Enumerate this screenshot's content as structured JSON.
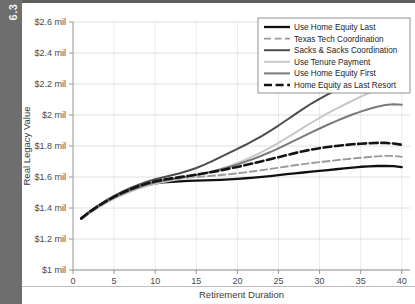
{
  "figure": {
    "spine_label": "6.3",
    "background": "#ffffff",
    "spine_color": "#6e6e6e"
  },
  "chart_data": {
    "type": "line",
    "title": "",
    "xlabel": "Retirement Duration",
    "ylabel": "Real Legacy Value",
    "xlim": [
      0,
      41
    ],
    "ylim": [
      1.0,
      2.6
    ],
    "xticks": [
      0,
      5,
      10,
      15,
      20,
      25,
      30,
      35,
      40
    ],
    "xticklabels": [
      "0",
      "5",
      "10",
      "15",
      "20",
      "25",
      "30",
      "35",
      "40"
    ],
    "yticks": [
      1.0,
      1.2,
      1.4,
      1.6,
      1.8,
      2.0,
      2.2,
      2.4,
      2.6
    ],
    "yticklabels": [
      "$1 mil",
      "$1.2 mil",
      "$1.4 mil",
      "$1.6 mil",
      "$1.8 mil",
      "$2 mil",
      "$2.2 mil",
      "$2.4 mil",
      "$2.6 mil"
    ],
    "units": "millions of dollars",
    "grid": {
      "horizontal": true,
      "vertical": true
    },
    "legend": {
      "position": "top-right",
      "border": true
    },
    "x": [
      1,
      2,
      3,
      4,
      5,
      6,
      7,
      8,
      9,
      10,
      11,
      12,
      13,
      14,
      15,
      16,
      17,
      18,
      19,
      20,
      21,
      22,
      23,
      24,
      25,
      26,
      27,
      28,
      29,
      30,
      31,
      32,
      33,
      34,
      35,
      36,
      37,
      38,
      39,
      40
    ],
    "series": [
      {
        "name": "Use Home Equity Last",
        "color": "#111111",
        "width": 2.3,
        "dash": "none",
        "values": [
          1.33,
          1.37,
          1.405,
          1.437,
          1.465,
          1.49,
          1.512,
          1.531,
          1.547,
          1.559,
          1.566,
          1.569,
          1.572,
          1.575,
          1.577,
          1.578,
          1.58,
          1.582,
          1.585,
          1.588,
          1.592,
          1.596,
          1.601,
          1.606,
          1.612,
          1.618,
          1.624,
          1.629,
          1.634,
          1.639,
          1.644,
          1.65,
          1.656,
          1.661,
          1.666,
          1.669,
          1.671,
          1.672,
          1.67,
          1.664
        ]
      },
      {
        "name": "Texas Tech Coordination",
        "color": "#9a9a9a",
        "width": 1.9,
        "dash": "7,3.5",
        "values": [
          1.332,
          1.373,
          1.409,
          1.442,
          1.471,
          1.497,
          1.52,
          1.54,
          1.557,
          1.571,
          1.58,
          1.586,
          1.591,
          1.596,
          1.6,
          1.604,
          1.608,
          1.613,
          1.618,
          1.624,
          1.63,
          1.637,
          1.644,
          1.652,
          1.66,
          1.668,
          1.676,
          1.683,
          1.69,
          1.696,
          1.702,
          1.708,
          1.714,
          1.719,
          1.724,
          1.729,
          1.733,
          1.736,
          1.736,
          1.73
        ]
      },
      {
        "name": "Sacks & Sacks Coordination",
        "color": "#4d4d4d",
        "width": 2.0,
        "dash": "none",
        "values": [
          1.334,
          1.377,
          1.414,
          1.448,
          1.478,
          1.505,
          1.529,
          1.551,
          1.57,
          1.586,
          1.599,
          1.611,
          1.624,
          1.64,
          1.658,
          1.68,
          1.704,
          1.73,
          1.756,
          1.782,
          1.808,
          1.836,
          1.866,
          1.898,
          1.932,
          1.968,
          2.004,
          2.04,
          2.074,
          2.104,
          2.133,
          2.16,
          2.186,
          2.212,
          2.238,
          2.262,
          2.282,
          2.296,
          2.304,
          2.3
        ]
      },
      {
        "name": "Use Tenure Payment",
        "color": "#c8c8c8",
        "width": 2.0,
        "dash": "none",
        "values": [
          1.329,
          1.368,
          1.402,
          1.433,
          1.46,
          1.484,
          1.506,
          1.525,
          1.542,
          1.556,
          1.568,
          1.578,
          1.588,
          1.598,
          1.609,
          1.622,
          1.636,
          1.652,
          1.67,
          1.69,
          1.712,
          1.736,
          1.762,
          1.79,
          1.82,
          1.852,
          1.885,
          1.918,
          1.95,
          1.982,
          2.012,
          2.04,
          2.066,
          2.092,
          2.118,
          2.142,
          2.164,
          2.182,
          2.196,
          2.2
        ]
      },
      {
        "name": "Use Home Equity First",
        "color": "#7a7a7a",
        "width": 2.0,
        "dash": "none",
        "values": [
          1.331,
          1.371,
          1.407,
          1.439,
          1.467,
          1.492,
          1.514,
          1.534,
          1.551,
          1.565,
          1.576,
          1.585,
          1.594,
          1.603,
          1.613,
          1.624,
          1.636,
          1.65,
          1.665,
          1.681,
          1.699,
          1.718,
          1.739,
          1.761,
          1.785,
          1.81,
          1.836,
          1.862,
          1.888,
          1.913,
          1.937,
          1.96,
          1.982,
          2.003,
          2.022,
          2.039,
          2.053,
          2.064,
          2.07,
          2.066
        ]
      },
      {
        "name": "Home Equity as Last Resort",
        "color": "#141414",
        "width": 2.6,
        "dash": "8,3.6",
        "values": [
          1.333,
          1.374,
          1.41,
          1.443,
          1.472,
          1.498,
          1.521,
          1.541,
          1.558,
          1.572,
          1.583,
          1.591,
          1.599,
          1.607,
          1.615,
          1.624,
          1.633,
          1.643,
          1.654,
          1.665,
          1.677,
          1.689,
          1.702,
          1.715,
          1.728,
          1.741,
          1.754,
          1.766,
          1.777,
          1.786,
          1.794,
          1.8,
          1.806,
          1.811,
          1.815,
          1.818,
          1.82,
          1.82,
          1.816,
          1.808
        ]
      }
    ]
  }
}
